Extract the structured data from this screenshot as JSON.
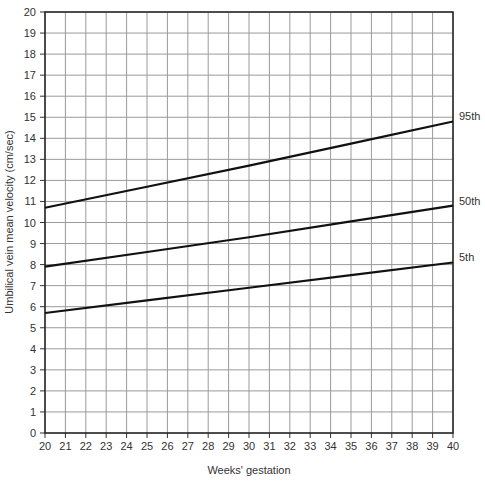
{
  "chart_data": {
    "type": "line",
    "title": "",
    "xlabel": "Weeks' gestation",
    "ylabel": "Umbilical vein mean velocity (cm/sec)",
    "xlim": [
      20,
      40
    ],
    "ylim": [
      0,
      20
    ],
    "grid": true,
    "x_ticks": [
      20,
      21,
      22,
      23,
      24,
      25,
      26,
      27,
      28,
      29,
      30,
      31,
      32,
      33,
      34,
      35,
      36,
      37,
      38,
      39,
      40
    ],
    "y_ticks": [
      0,
      1,
      2,
      3,
      4,
      5,
      6,
      7,
      8,
      9,
      10,
      11,
      12,
      13,
      14,
      15,
      16,
      17,
      18,
      19,
      20
    ],
    "x": [
      20,
      25,
      30,
      35,
      40
    ],
    "series": [
      {
        "name": "95th",
        "values": [
          10.7,
          11.7,
          12.7,
          13.75,
          14.8
        ]
      },
      {
        "name": "50th",
        "values": [
          7.9,
          8.6,
          9.3,
          10.05,
          10.8
        ]
      },
      {
        "name": "5th",
        "values": [
          5.7,
          6.3,
          6.9,
          7.5,
          8.1
        ]
      }
    ],
    "legend_position": "right-inline labels"
  }
}
